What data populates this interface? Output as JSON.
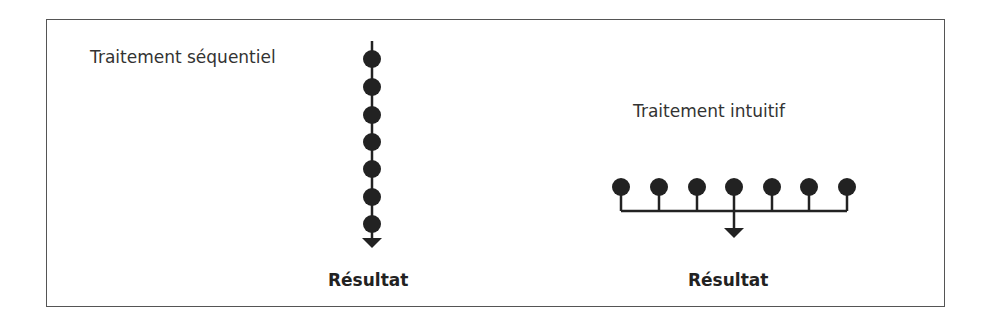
{
  "diagram": {
    "sequential": {
      "label": "Traitement séquentiel",
      "result_label": "Résultat",
      "node_count": 7
    },
    "intuitive": {
      "label": "Traitement intuitif",
      "result_label": "Résultat",
      "node_count": 7
    },
    "colors": {
      "node": "#222222",
      "line": "#222222",
      "border": "#555555",
      "text": "#333333"
    }
  }
}
